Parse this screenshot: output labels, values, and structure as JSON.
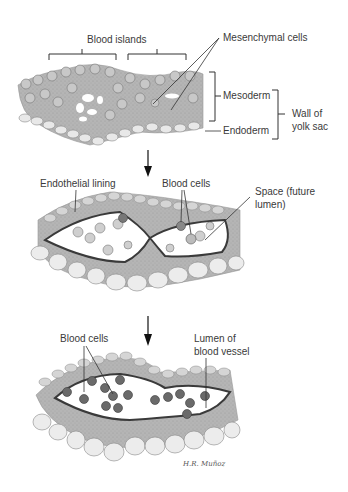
{
  "diagram": {
    "colors": {
      "tissue": "#b8b8b8",
      "tissue_dark": "#8c8c8c",
      "endothelium": "#4a4a4a",
      "blood_cell": "#6a6a6a",
      "endoderm_cell": "#e6e6e6",
      "lumen": "#ffffff",
      "line": "#2a2a2a"
    },
    "panels": [
      {
        "id": "stage-1",
        "labels": {
          "blood_islands": "Blood islands",
          "mesenchymal_cells": "Mesenchymal cells",
          "mesoderm": "Mesoderm",
          "endoderm": "Endoderm",
          "wall_line1": "Wall of",
          "wall_line2": "yolk sac"
        }
      },
      {
        "id": "stage-2",
        "labels": {
          "endothelial_lining": "Endothelial lining",
          "blood_cells": "Blood cells",
          "space_line1": "Space (future",
          "space_line2": "lumen)"
        }
      },
      {
        "id": "stage-3",
        "labels": {
          "blood_cells": "Blood cells",
          "lumen_line1": "Lumen of",
          "lumen_line2": "blood vessel"
        }
      }
    ],
    "arrows": [
      {
        "from": "stage-1",
        "to": "stage-2"
      },
      {
        "from": "stage-2",
        "to": "stage-3"
      }
    ],
    "signature": "H.R. Muñoz"
  }
}
